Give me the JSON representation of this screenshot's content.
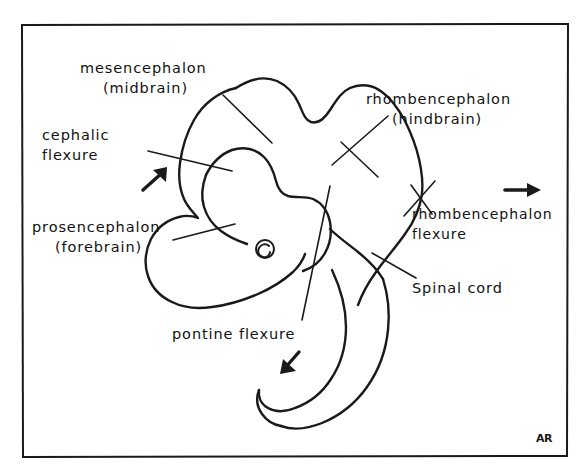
{
  "figure": {
    "background_color": "#ffffff",
    "ink_color": "#1a1a1a",
    "frame": {
      "name": "hand-drawn rectangular border",
      "left": 22,
      "top": 24,
      "right": 568,
      "bottom": 456
    },
    "signature": "AR"
  },
  "labels": {
    "mesencephalon": {
      "line1": "mesencephalon",
      "line2": "(midbrain)",
      "x": 80,
      "y": 73
    },
    "cephalic_flexure": {
      "line1": "cephalic",
      "line2": "flexure",
      "x": 42,
      "y": 140
    },
    "prosencephalon": {
      "line1": "prosencephalon",
      "line2": "(forebrain)",
      "x": 32,
      "y": 232
    },
    "rhombencephalon": {
      "line1": "rhombencephalon",
      "line2": "(hindbrain)",
      "x": 366,
      "y": 104
    },
    "rhombencephalon_flexure": {
      "line1": "rhombencephalon",
      "line2": "flexure",
      "x": 412,
      "y": 219
    },
    "spinal_cord": {
      "line1": "Spinal cord",
      "x": 412,
      "y": 293
    },
    "pontine_flexure": {
      "line1": "pontine flexure",
      "x": 172,
      "y": 339
    }
  },
  "arrows": [
    {
      "name": "cephalic-flexure-arrow",
      "direction": "up-right",
      "x": 152,
      "y": 180
    },
    {
      "name": "lateral-direction-arrow",
      "direction": "right",
      "x": 520,
      "y": 190
    },
    {
      "name": "pontine-flexure-arrow",
      "direction": "down-left",
      "x": 290,
      "y": 363
    }
  ],
  "structures": [
    {
      "name": "prosencephalon-vesicle",
      "description": "rounded forebrain vesicle, lower-left of the brain outline"
    },
    {
      "name": "mesencephalon-vesicle",
      "description": "upper-left dome of the brain outline"
    },
    {
      "name": "rhombencephalon-vesicle",
      "description": "upper-right lobed region of the brain outline"
    },
    {
      "name": "optic-vesicle-eye",
      "description": "small spiral circle marking the developing eye"
    },
    {
      "name": "spinal-cord-tube",
      "description": "long tube curving down and hooking to the left at the bottom"
    }
  ]
}
